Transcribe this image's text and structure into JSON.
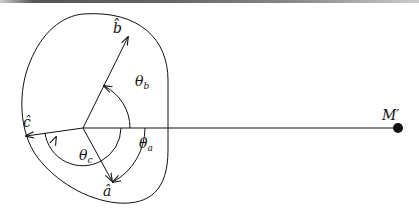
{
  "diagram": {
    "type": "vector-angle-diagram",
    "origin_point": {
      "x": 83,
      "y": 128
    },
    "vectors": [
      {
        "name": "b",
        "label": "b̂",
        "tip": {
          "x": 128,
          "y": 37
        }
      },
      {
        "name": "c",
        "label": "ĉ",
        "tip": {
          "x": 26,
          "y": 136
        }
      },
      {
        "name": "a",
        "label": "â",
        "tip": {
          "x": 112,
          "y": 181
        }
      }
    ],
    "angles": [
      {
        "name": "theta_b",
        "symbol": "θ",
        "subscript": "b"
      },
      {
        "name": "theta_a",
        "symbol": "θ",
        "subscript": "a"
      },
      {
        "name": "theta_c",
        "symbol": "θ",
        "subscript": "c"
      }
    ],
    "point": {
      "label": "M",
      "prime": "′"
    },
    "colors": {
      "stroke": "#111111",
      "background": "#ffffff"
    }
  }
}
